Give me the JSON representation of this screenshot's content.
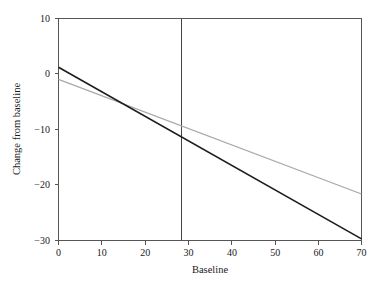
{
  "chart_data": {
    "type": "line",
    "title": "",
    "xlabel": "Baseline",
    "ylabel": "Change from baseline",
    "xlim": [
      0,
      70
    ],
    "ylim": [
      -30,
      10
    ],
    "xticks": [
      0,
      10,
      20,
      30,
      40,
      50,
      60,
      70
    ],
    "yticks": [
      10,
      0,
      -10,
      -20,
      -30
    ],
    "xtick_labels": [
      "0",
      "10",
      "20",
      "30",
      "40",
      "50",
      "60",
      "70"
    ],
    "ytick_labels": [
      "10",
      "0",
      "−10",
      "−20",
      "−30"
    ],
    "grid": false,
    "legend": "none",
    "series": [
      {
        "name": "steeper-regression-line",
        "color": "#1c1c1c",
        "width": 1.6,
        "x": [
          0,
          70
        ],
        "values": [
          1.2,
          -29.8
        ]
      },
      {
        "name": "shallower-regression-line",
        "color": "#a8a8a8",
        "width": 1.2,
        "x": [
          0,
          70
        ],
        "values": [
          -1.0,
          -21.7
        ]
      }
    ],
    "annotations": [
      {
        "name": "vertical-reference-line",
        "type": "vline",
        "x": 28.5,
        "color": "#444444"
      }
    ]
  }
}
